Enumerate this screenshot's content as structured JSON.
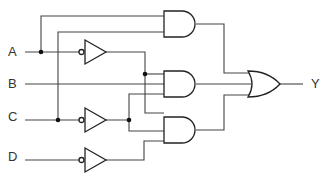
{
  "diagram": {
    "type": "logic-circuit",
    "inputs": [
      {
        "id": "A",
        "label": "A"
      },
      {
        "id": "B",
        "label": "B"
      },
      {
        "id": "C",
        "label": "C"
      },
      {
        "id": "D",
        "label": "D"
      }
    ],
    "output": {
      "id": "Y",
      "label": "Y"
    },
    "gates": [
      {
        "id": "not1",
        "type": "NOT",
        "input": "A"
      },
      {
        "id": "not2",
        "type": "NOT",
        "input": "C"
      },
      {
        "id": "not3",
        "type": "NOT",
        "input": "D"
      },
      {
        "id": "and1",
        "type": "AND",
        "inputs": [
          "A",
          "C"
        ]
      },
      {
        "id": "and2",
        "type": "AND",
        "inputs": [
          "not1",
          "B",
          "not2"
        ]
      },
      {
        "id": "and3",
        "type": "AND",
        "inputs": [
          "not1",
          "not2",
          "not3"
        ]
      },
      {
        "id": "or1",
        "type": "OR",
        "inputs": [
          "and1",
          "and2",
          "and3"
        ],
        "output": "Y"
      }
    ],
    "colors": {
      "wire": "#444444",
      "gate_stroke": "#222222",
      "background": "#ffffff"
    }
  }
}
